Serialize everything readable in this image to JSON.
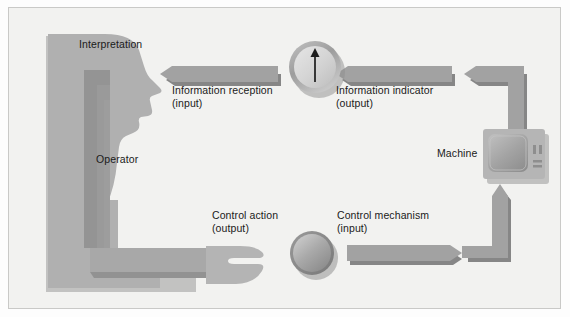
{
  "figure": {
    "background_color": "#f2f2f0",
    "border_color": "#c9c9c7",
    "width": 570,
    "height": 317
  },
  "palette": {
    "shape_fill": "#a9a9a9",
    "shape_fill_light": "#b8b8b8",
    "shape_fill_dark": "#8f8f8f",
    "shape_shadow": "#949494",
    "arrow_fill": "#9e9e9e",
    "arrow_shadow": "#868686",
    "text_color": "#1a1a1a",
    "needle_color": "#1a1a1a",
    "machine_body": "#b0b0b0",
    "machine_screen": "#9a9a9a"
  },
  "labels": {
    "interpretation": "Interpretation",
    "operator": "Operator",
    "machine": "Machine",
    "information_reception": "Information reception\n(input)",
    "information_indicator": "Information indicator\n(output)",
    "control_action": "Control action\n(output)",
    "control_mechanism": "Control mechanism\n(input)"
  },
  "nodes": [
    {
      "id": "operator",
      "name": "operator-silhouette",
      "label": "Operator",
      "shape": "human-head-profile-seated"
    },
    {
      "id": "indicator",
      "name": "gauge-indicator",
      "label": "Information indicator",
      "shape": "circular-dial-with-needle",
      "needle_direction": "up"
    },
    {
      "id": "machine",
      "name": "machine-monitor",
      "label": "Machine",
      "shape": "crt-monitor"
    },
    {
      "id": "control",
      "name": "control-knob",
      "label": "Control mechanism",
      "shape": "circular-knob"
    }
  ],
  "flows": [
    {
      "id": "info-reception",
      "label": "Information reception\n(input)",
      "from": "indicator",
      "to": "operator",
      "direction": "left"
    },
    {
      "id": "info-indicator",
      "label": "Information indicator\n(output)",
      "from": "machine",
      "to": "indicator",
      "direction": "left"
    },
    {
      "id": "control-action",
      "label": "Control action\n(output)",
      "from": "operator",
      "to": "control",
      "direction": "right"
    },
    {
      "id": "control-mechanism",
      "label": "Control mechanism\n(input)",
      "from": "control",
      "to": "machine",
      "direction": "right"
    }
  ]
}
